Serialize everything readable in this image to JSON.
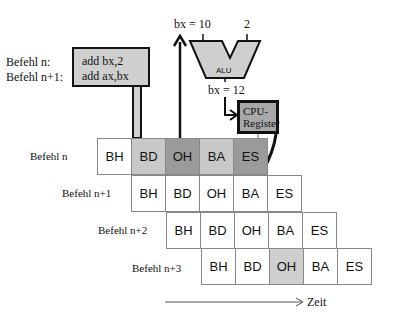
{
  "instructions": {
    "labels": [
      "Befehl n:",
      "Befehl n+1:"
    ],
    "code": [
      "add   bx,2",
      "add   ax,bx"
    ]
  },
  "alu": {
    "label": "ALU",
    "input_left": "bx = 10",
    "input_right": "2",
    "output": "bx = 12"
  },
  "register": {
    "label_line1": "CPU-",
    "label_line2": "Register"
  },
  "pipeline": {
    "rows": [
      {
        "label": "Befehl n",
        "stages": [
          "BH",
          "BD",
          "OH",
          "BA",
          "ES"
        ],
        "fills": [
          "#ffffff",
          "#c8c8c8",
          "#9a9a9a",
          "#c8c8c8",
          "#9a9a9a"
        ]
      },
      {
        "label": "Befehl n+1",
        "stages": [
          "BH",
          "BD",
          "OH",
          "BA",
          "ES"
        ],
        "fills": [
          "#ffffff",
          "#ffffff",
          "#ffffff",
          "#ffffff",
          "#ffffff"
        ]
      },
      {
        "label": "Befehl n+2",
        "stages": [
          "BH",
          "BD",
          "OH",
          "BA",
          "ES"
        ],
        "fills": [
          "#ffffff",
          "#ffffff",
          "#ffffff",
          "#ffffff",
          "#ffffff"
        ]
      },
      {
        "label": "Befehl n+3",
        "stages": [
          "BH",
          "BD",
          "OH",
          "BA",
          "ES"
        ],
        "fills": [
          "#ffffff",
          "#ffffff",
          "#cfcfcf",
          "#ffffff",
          "#ffffff"
        ]
      }
    ]
  },
  "time_axis": {
    "label": "Zeit"
  }
}
